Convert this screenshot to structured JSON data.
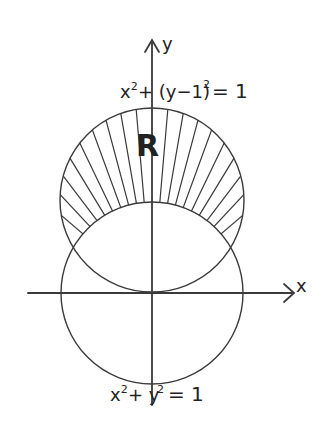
{
  "diagram": {
    "axes": {
      "x_label": "x",
      "y_label": "y"
    },
    "upper_circle": {
      "equation": "x² + (y−1)² = 1",
      "eq_lhs_a": "x",
      "eq_lhs_b": "+ (y−1)",
      "eq_rhs": "= 1"
    },
    "lower_circle": {
      "equation": "x² + y² = 1",
      "eq_lhs_a": "x",
      "eq_lhs_b": "+ y",
      "eq_rhs": "= 1"
    },
    "region_label": "R",
    "exponent": "2",
    "ink_color": "#3a3a3a"
  }
}
